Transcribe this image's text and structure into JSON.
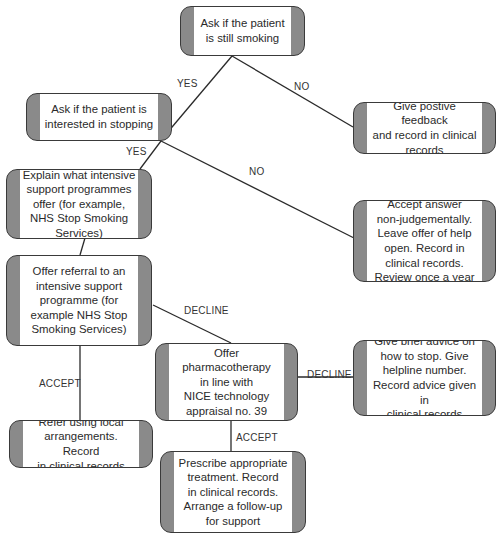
{
  "diagram": {
    "type": "flowchart",
    "nodes": {
      "still_smoking": "Ask if the patient\nis still smoking",
      "interested": "Ask if the patient is\ninterested in stopping",
      "positive_feedback": "Give postive feedback\nand record in clinical\nrecords",
      "explain_programmes": "Explain what intensive\nsupport programmes\noffer (for example,\nNHS Stop Smoking\nServices)",
      "accept_answer": "Accept answer\nnon-judgementally.\nLeave offer of help\nopen. Record in\nclinical records.\nReview once a year",
      "offer_referral": "Offer referral to an\nintensive support\nprogramme (for\nexample NHS Stop\nSmoking Services)",
      "offer_pharmacotherapy": "Offer\npharmacotherapy\nin line with\nNICE technology\nappraisal no. 39",
      "brief_advice": "Give brief advice on\nhow to stop. Give\nhelpline number.\nRecord advice given in\nclinical records",
      "refer_local": "Refer using local\narrangements. Record\nin clinical records",
      "prescribe": "Prescribe appropriate\ntreatment. Record\nin clinical records.\nArrange a follow-up\nfor support"
    },
    "edge_labels": {
      "still_smoking_yes": "YES",
      "still_smoking_no": "NO",
      "interested_yes": "YES",
      "interested_no": "NO",
      "referral_decline": "DECLINE",
      "referral_accept": "ACCEPT",
      "pharmacotherapy_decline": "DECLINE",
      "pharmacotherapy_accept": "ACCEPT"
    },
    "colors": {
      "box_side": "#8a8a8a",
      "box_border": "#3a3a3a",
      "line": "#2a2a2a",
      "text": "#2a2a2a"
    }
  }
}
